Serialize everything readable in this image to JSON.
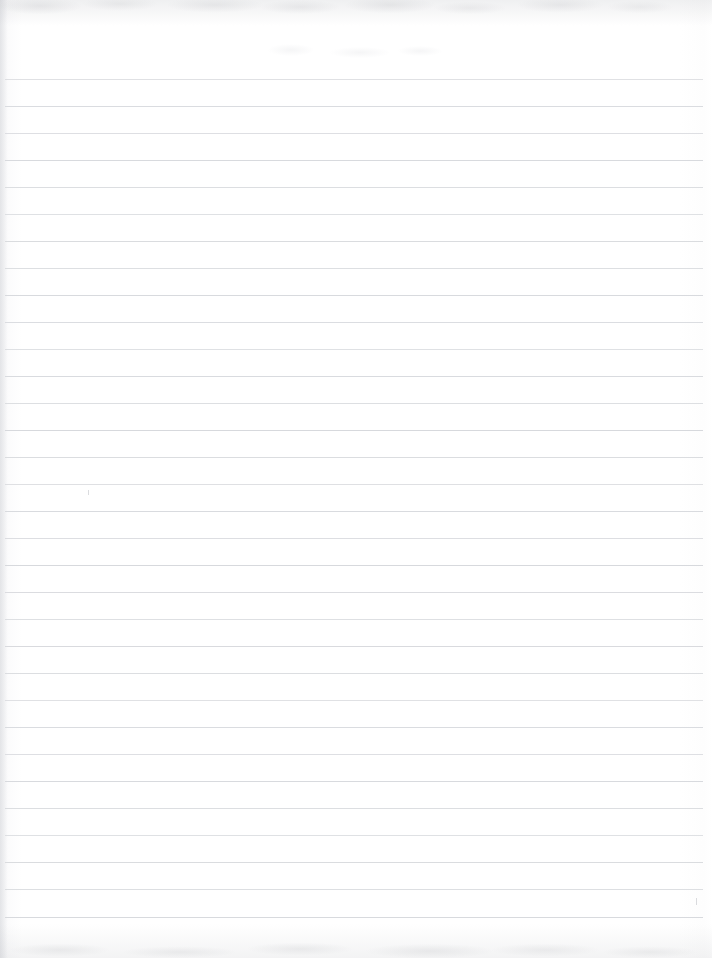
{
  "document": {
    "kind": "scanned-ruled-notebook-page",
    "title": "Blank Ruled Notebook Page",
    "page_width": 712,
    "page_height": 958,
    "paper_color": "#ffffff",
    "visible_text": "",
    "handwriting": "none"
  },
  "ruling": {
    "line_color": "#d7d9dd",
    "line_thickness": 1,
    "line_spacing": 27,
    "first_line_y": 79,
    "line_count": 32,
    "line_left_x": 5,
    "line_right_x": 703,
    "lines_y": [
      79,
      106,
      133,
      160,
      187,
      214,
      241,
      268,
      295,
      322,
      349,
      376,
      403,
      430,
      457,
      484,
      511,
      538,
      565,
      592,
      619,
      646,
      673,
      700,
      727,
      754,
      781,
      808,
      835,
      862,
      889,
      917
    ]
  },
  "scan_artifacts": {
    "top_band_color": "#a8aab0",
    "top_band_height": 26,
    "bottom_band_color": "#a8aab0",
    "bottom_band_height": 34,
    "left_edge_shadow_width": 8,
    "smudges": [
      {
        "x": 268,
        "y": 44,
        "w": 46,
        "h": 12
      },
      {
        "x": 330,
        "y": 47,
        "w": 60,
        "h": 11
      },
      {
        "x": 398,
        "y": 46,
        "w": 44,
        "h": 10
      }
    ],
    "pencil_marks": [
      {
        "x": 88,
        "y": 490,
        "w": 1,
        "h": 5
      },
      {
        "x": 696,
        "y": 898,
        "w": 1,
        "h": 7
      }
    ]
  }
}
